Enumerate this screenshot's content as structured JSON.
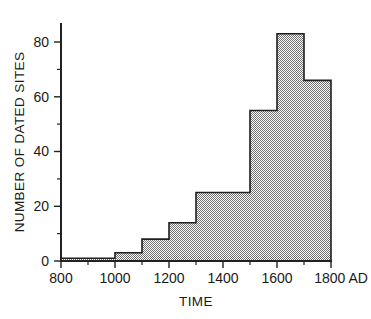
{
  "chart_data": {
    "type": "bar",
    "title": "",
    "xlabel": "TIME",
    "ylabel": "NUMBER OF DATED SITES",
    "xlim": [
      800,
      1800
    ],
    "ylim": [
      0,
      88
    ],
    "grid": false,
    "legend": null,
    "x_axis_suffix": "AD",
    "bin_edges": [
      800,
      1000,
      1100,
      1200,
      1300,
      1400,
      1500,
      1600,
      1700,
      1800
    ],
    "categories": [
      "800-1000",
      "1000-1100",
      "1100-1200",
      "1200-1300",
      "1300-1400",
      "1400-1500",
      "1500-1600",
      "1600-1700",
      "1700-1800"
    ],
    "values": [
      1,
      3,
      8,
      14,
      25,
      25,
      55,
      83,
      66
    ],
    "x_ticks": [
      800,
      1000,
      1200,
      1400,
      1600,
      1800
    ],
    "x_tick_labels": [
      "800",
      "1000",
      "1200",
      "1400",
      "1600",
      "1800 AD"
    ],
    "x_minor_ticks": [
      900,
      1100,
      1300,
      1500,
      1700
    ],
    "y_ticks": [
      0,
      20,
      40,
      60,
      80
    ],
    "y_tick_labels": [
      "0",
      "20",
      "40",
      "60",
      "80"
    ],
    "y_minor_ticks": [
      10,
      30,
      50,
      70
    ]
  },
  "colors": {
    "background": "#ffffff",
    "axis": "#222222",
    "bar_fill": "#a8a8a8",
    "bar_outline": "#1f1f1f",
    "text": "#1a1a1a"
  },
  "labels": {
    "y_axis_title": "NUMBER OF DATED SITES",
    "x_axis_title": "TIME",
    "y0": "0",
    "y20": "20",
    "y40": "40",
    "y60": "60",
    "y80": "80",
    "x800": "800",
    "x1000": "1000",
    "x1200": "1200",
    "x1400": "1400",
    "x1600": "1600",
    "x1800": "1800 AD"
  }
}
